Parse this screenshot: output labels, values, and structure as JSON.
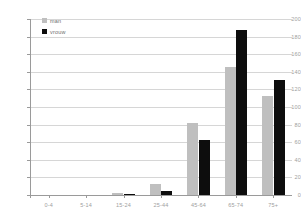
{
  "chart_data": {
    "type": "bar",
    "title": "",
    "xlabel": "",
    "ylabel": "",
    "ylim": [
      0,
      200
    ],
    "ytick_step": 20,
    "grid": "horizontal",
    "legend_position": "top-left-inside",
    "categories": [
      "0-4",
      "5-14",
      "15-24",
      "25-44",
      "45-64",
      "65-74",
      "75+"
    ],
    "series": [
      {
        "name": "man",
        "color": "#bfbfbf",
        "values": [
          0,
          0,
          2,
          13,
          82,
          146,
          112
        ]
      },
      {
        "name": "vrouw",
        "color": "#0d0d0d",
        "values": [
          0,
          0,
          1,
          4,
          62,
          188,
          131
        ]
      }
    ],
    "yticks": [
      0,
      20,
      40,
      60,
      80,
      100,
      120,
      140,
      160,
      180,
      200
    ]
  },
  "colors": {
    "man": "#bfbfbf",
    "vrouw": "#0d0d0d",
    "grid": "#d6d6d6",
    "axis": "#9a9a9a",
    "tick_text": "#9e9e9e",
    "background": "#ffffff"
  }
}
